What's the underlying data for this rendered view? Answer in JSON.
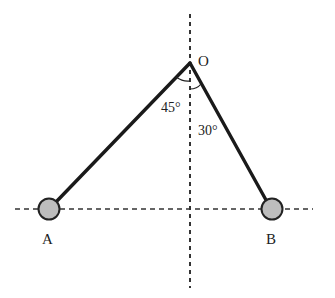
{
  "figure": {
    "width": 335,
    "height": 298,
    "background": "#ffffff"
  },
  "colors": {
    "rod": "#1a1a1a",
    "dash": "#333333",
    "ball_fill": "#bdbdbd",
    "ball_stroke": "#222222",
    "text": "#222222"
  },
  "pivot": {
    "label": "O",
    "x": 190,
    "y": 63
  },
  "axes": {
    "vertical": {
      "x": 190,
      "y1": 14,
      "y2": 288,
      "style": "dashed"
    },
    "horizontal": {
      "y": 209,
      "x1": 15,
      "x2": 313,
      "style": "dashed"
    }
  },
  "balls": [
    {
      "label": "A",
      "x": 49,
      "y": 209,
      "r": 10.5
    },
    {
      "label": "B",
      "x": 272,
      "y": 209,
      "r": 10.5
    }
  ],
  "angles": [
    {
      "label": "45°",
      "between": "OA and vertical"
    },
    {
      "label": "30°",
      "between": "OB and vertical"
    }
  ],
  "labels": {
    "pivot": "O",
    "angle_left": "45°",
    "angle_right": "30°",
    "ball_a": "A",
    "ball_b": "B"
  }
}
